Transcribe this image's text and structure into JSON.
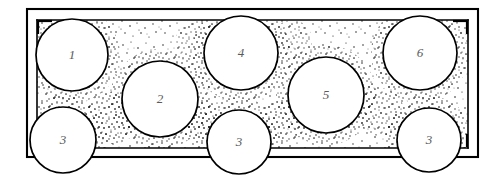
{
  "figure": {
    "type": "technical-line-drawing",
    "width": 492,
    "height": 183,
    "background_color": "#ffffff",
    "line_color": "#000000",
    "label_color": "#5a5a5a",
    "fill_texture": "stipple",
    "fill_texture_description": "speckled granular stipple pattern",
    "container": {
      "name": "outer-frame",
      "outer": {
        "x": 27,
        "y": 9,
        "width": 451,
        "height": 148
      },
      "inner": {
        "x": 37,
        "y": 20,
        "width": 431,
        "height": 128
      },
      "corner_tick_color": "#000000"
    },
    "circles": [
      {
        "id": "circle-1",
        "label": "1",
        "cx": 72,
        "cy": 55,
        "r": 36
      },
      {
        "id": "circle-2",
        "label": "2",
        "cx": 160,
        "cy": 99,
        "r": 38
      },
      {
        "id": "circle-3-left",
        "label": "3",
        "cx": 63,
        "cy": 140,
        "r": 33
      },
      {
        "id": "circle-4",
        "label": "4",
        "cx": 241,
        "cy": 53,
        "r": 37
      },
      {
        "id": "circle-3-middle",
        "label": "3",
        "cx": 239,
        "cy": 142,
        "r": 32
      },
      {
        "id": "circle-5",
        "label": "5",
        "cx": 326,
        "cy": 95,
        "r": 38
      },
      {
        "id": "circle-6",
        "label": "6",
        "cx": 420,
        "cy": 53,
        "r": 37
      },
      {
        "id": "circle-3-right",
        "label": "3",
        "cx": 429,
        "cy": 140,
        "r": 32
      }
    ],
    "legend_numbers": [
      "1",
      "2",
      "3",
      "4",
      "5",
      "6"
    ]
  }
}
